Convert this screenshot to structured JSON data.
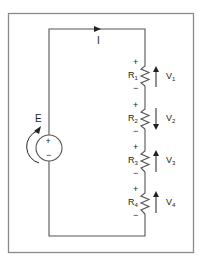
{
  "diagram": {
    "type": "series-circuit",
    "source": {
      "label": "E",
      "plus": "+",
      "minus": "−"
    },
    "current": {
      "label": "I",
      "direction": "clockwise"
    },
    "resistors": [
      {
        "name": "R",
        "sub": "1",
        "plus": "+",
        "minus": "−",
        "voltage": "V",
        "vsub": "1",
        "arrow": "up"
      },
      {
        "name": "R",
        "sub": "2",
        "plus": "+",
        "minus": "−",
        "voltage": "V",
        "vsub": "2",
        "arrow": "down"
      },
      {
        "name": "R",
        "sub": "3",
        "plus": "+",
        "minus": "−",
        "voltage": "V",
        "vsub": "3",
        "arrow": "up"
      },
      {
        "name": "R",
        "sub": "4",
        "plus": "+",
        "minus": "−",
        "voltage": "V",
        "vsub": "4",
        "arrow": "up"
      }
    ],
    "colors": {
      "wire": "#555555",
      "frame": "#8a8a8a",
      "text": "#222222"
    }
  }
}
